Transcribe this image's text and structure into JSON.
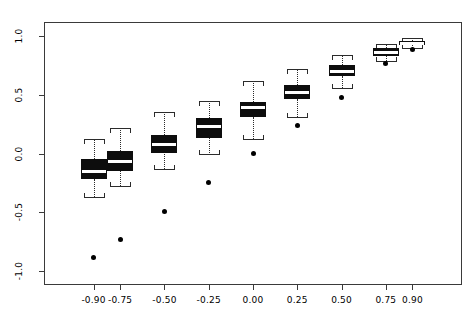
{
  "chart_data": {
    "type": "boxplot",
    "title": "",
    "xlabel": "",
    "ylabel": "",
    "xlim": [
      -1.18,
      1.18
    ],
    "ylim": [
      -1.12,
      1.12
    ],
    "grid": false,
    "legend": false,
    "y_ticks": [
      "1.0",
      "0.5",
      "0.0",
      "-0.5",
      "-1.0"
    ],
    "y_tick_values": [
      1.0,
      0.5,
      0.0,
      -0.5,
      -1.0
    ],
    "x_ticks": [
      "-0.90",
      "-0.75",
      "-0.50",
      "-0.25",
      "0.00",
      "0.25",
      "0.50",
      "0.75",
      "0.90"
    ],
    "x_tick_values": [
      -0.9,
      -0.75,
      -0.5,
      -0.25,
      0.0,
      0.25,
      0.5,
      0.75,
      0.9
    ],
    "categories": [
      "-0.90",
      "-0.75",
      "-0.50",
      "-0.25",
      "0.00",
      "0.25",
      "0.50",
      "0.75",
      "0.90"
    ],
    "boxes": [
      {
        "category": "-0.90",
        "whisker_low": -0.37,
        "q1": -0.22,
        "median": -0.15,
        "q3": -0.05,
        "whisker_high": 0.12,
        "outliers": [
          -0.89
        ]
      },
      {
        "category": "-0.75",
        "whisker_low": -0.28,
        "q1": -0.15,
        "median": -0.07,
        "q3": 0.02,
        "whisker_high": 0.22,
        "outliers": [
          -0.73
        ]
      },
      {
        "category": "-0.50",
        "whisker_low": -0.13,
        "q1": 0.0,
        "median": 0.08,
        "q3": 0.16,
        "whisker_high": 0.35,
        "outliers": [
          -0.49
        ]
      },
      {
        "category": "-0.25",
        "whisker_low": 0.0,
        "q1": 0.13,
        "median": 0.23,
        "q3": 0.3,
        "whisker_high": 0.45,
        "outliers": [
          -0.25
        ]
      },
      {
        "category": "0.00",
        "whisker_low": 0.12,
        "q1": 0.31,
        "median": 0.39,
        "q3": 0.44,
        "whisker_high": 0.62,
        "outliers": [
          0.0
        ]
      },
      {
        "category": "0.25",
        "whisker_low": 0.31,
        "q1": 0.46,
        "median": 0.52,
        "q3": 0.58,
        "whisker_high": 0.72,
        "outliers": [
          0.24
        ]
      },
      {
        "category": "0.50",
        "whisker_low": 0.56,
        "q1": 0.66,
        "median": 0.7,
        "q3": 0.75,
        "whisker_high": 0.84,
        "outliers": [
          0.48
        ]
      },
      {
        "category": "0.75",
        "whisker_low": 0.79,
        "q1": 0.83,
        "median": 0.86,
        "q3": 0.9,
        "whisker_high": 0.93,
        "outliers": [
          0.77
        ]
      },
      {
        "category": "0.90",
        "whisker_low": 0.9,
        "q1": 0.92,
        "median": 0.94,
        "q3": 0.96,
        "whisker_high": 0.98,
        "outliers": [
          0.89
        ]
      }
    ]
  }
}
